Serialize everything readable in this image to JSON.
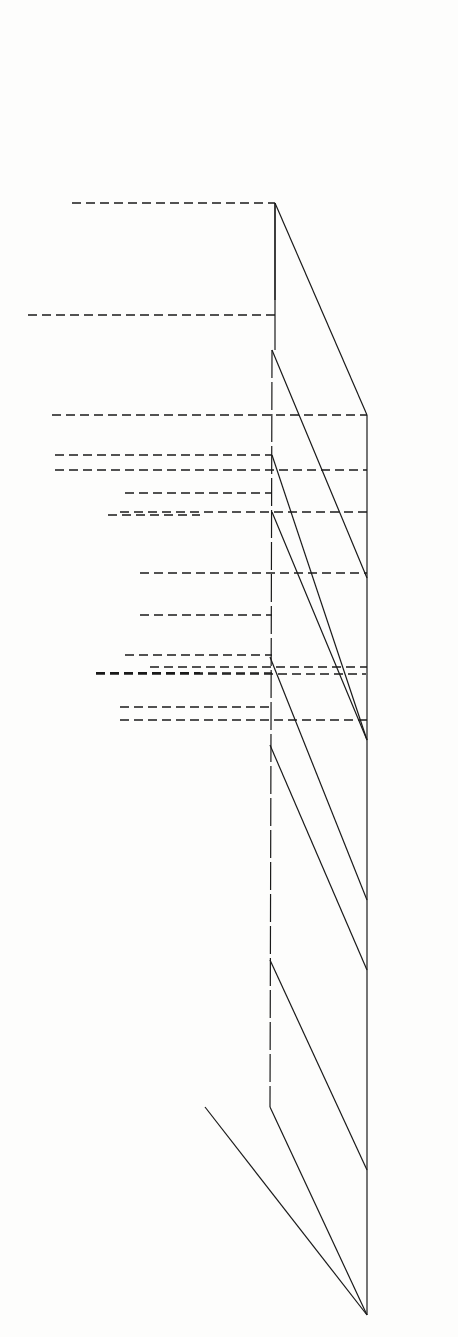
{
  "figure": {
    "orientation": "rotated 90 degrees clockwise",
    "colors": {
      "ink": "#1a1a1a",
      "paper": "#fdfdfc"
    }
  },
  "corners": {
    "S": {
      "label": "S",
      "species": [
        "C=OH",
        "+",
        "A⁻",
        "+",
        "Nuc"
      ],
      "charge_mark": "+",
      "text": "—C=OH + A⁻ + Nuc (protonated carbonyl)"
    },
    "R": {
      "label": "R",
      "species_text": "C=O + HA + Nuc",
      "text": "—C=O + HA + Nuc—"
    },
    "P": {
      "label": "P",
      "species_text": "C(OH) + A⁻ + Nuc",
      "oh_label": "OH",
      "plus": "+",
      "a_minus": "+ A⁻"
    },
    "Q": {
      "label": "Q",
      "species_text": "C(O⁻)(Nuc) + HA",
      "o_minus": "O⁻",
      "nuc": "Nuc",
      "plus": "+",
      "ha": "+ HA"
    }
  },
  "axes": {
    "energy_label_top": "Energy",
    "energy_label_bottom": "Energy",
    "coh_axis_label_upper": "C=O···H distance",
    "coh_increase_upper": "increase",
    "coh_decrease_upper": "decrease",
    "coh_axis_label_lower_a": "C=O···H",
    "coh_axis_label_lower_b": "distance",
    "coh_increase_lower": "increase",
    "coh_decrease_lower": "decrease",
    "cnuc_axis_label": "C···Nuc distance",
    "cnuc_increase": "increase",
    "cnuc_decrease": "decrease"
  },
  "annotations": {
    "transition_state": "*",
    "projected_ts": "*",
    "projected_ts_sub": "p"
  },
  "reactants_label": {
    "left_molecule": "C=O + HA + Nuc",
    "right_molecule": "C=OH + A⁻ + Nuc"
  }
}
